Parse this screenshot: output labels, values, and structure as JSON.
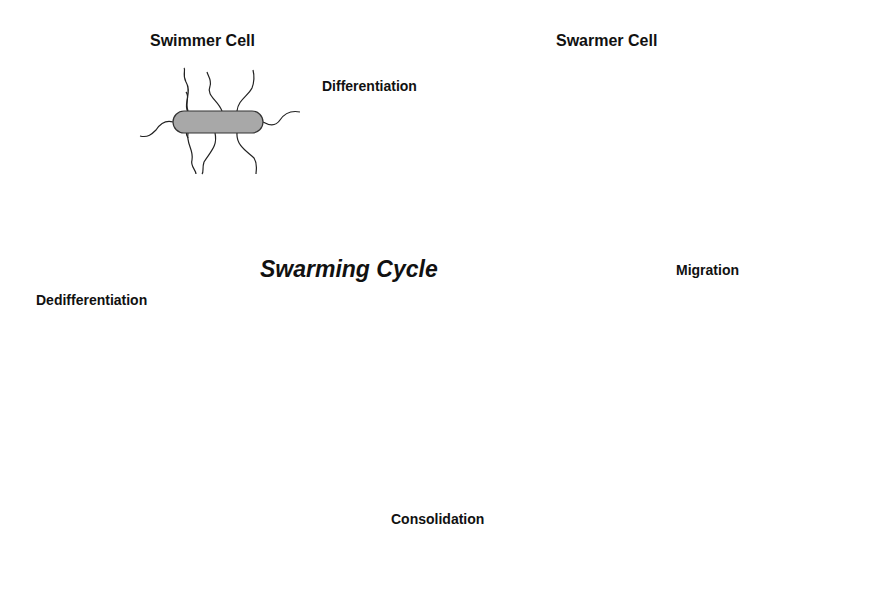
{
  "diagram": {
    "title": "Swarming Cycle",
    "nodes": {
      "swimmer": {
        "label": "Swimmer Cell"
      },
      "swarmer": {
        "label": "Swarmer Cell"
      },
      "migrating_group": {
        "label": ""
      },
      "consolidated_chain": {
        "label": ""
      }
    },
    "edges": [
      {
        "from": "swimmer",
        "to": "swarmer",
        "label": "Differentiation",
        "direction": "right"
      },
      {
        "from": "swarmer",
        "to": "migrating_group",
        "label": "Migration",
        "direction": "down"
      },
      {
        "from": "migrating_group",
        "to": "consolidated_chain",
        "label": "Consolidation",
        "direction": "left"
      },
      {
        "from": "consolidated_chain",
        "to": "swimmer",
        "label": "Dedifferentiation",
        "direction": "up"
      }
    ],
    "colors": {
      "cell_fill": "#a8a8a8",
      "outline": "#333333",
      "arrow": "#000000",
      "background": "#ffffff"
    }
  }
}
